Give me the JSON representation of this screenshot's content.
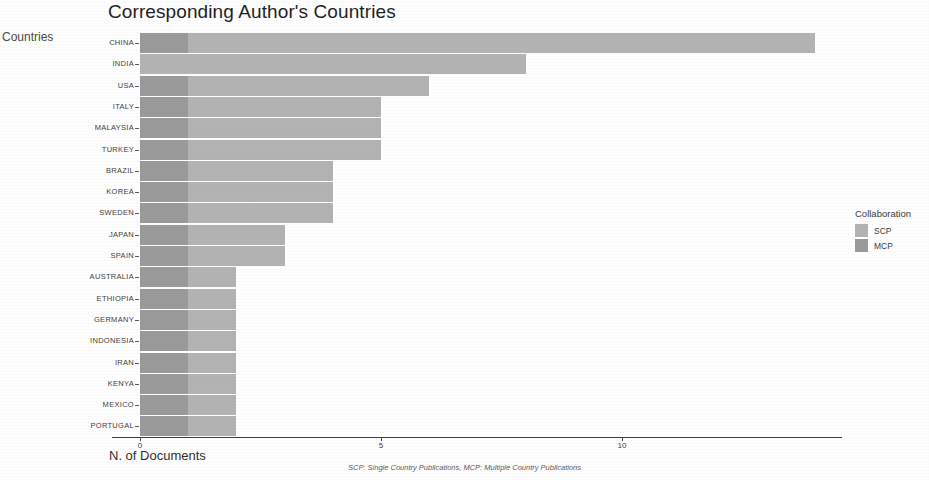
{
  "title": "Corresponding Author's Countries",
  "y_axis_title": "Countries",
  "x_axis_title": "N. of Documents",
  "caption": "SCP: Single Country Publications, MCP: Multiple Country Publications",
  "legend": {
    "title": "Collaboration",
    "items": [
      {
        "label": "SCP",
        "color": "#b3b3b3"
      },
      {
        "label": "MCP",
        "color": "#9a9a9a"
      }
    ]
  },
  "x_ticks": [
    {
      "label": "0",
      "value": 0
    },
    {
      "label": "5",
      "value": 5
    },
    {
      "label": "10",
      "value": 10
    }
  ],
  "chart_data": {
    "type": "bar",
    "orientation": "horizontal",
    "stacked": true,
    "title": "Corresponding Author's Countries",
    "xlabel": "N. of Documents",
    "ylabel": "Countries",
    "xlim": [
      0,
      14.5
    ],
    "grid": false,
    "legend_position": "right",
    "legend_title": "Collaboration",
    "categories": [
      "CHINA",
      "INDIA",
      "USA",
      "ITALY",
      "MALAYSIA",
      "TURKEY",
      "BRAZIL",
      "KOREA",
      "SWEDEN",
      "JAPAN",
      "SPAIN",
      "AUSTRALIA",
      "ETHIOPIA",
      "GERMANY",
      "INDONESIA",
      "IRAN",
      "KENYA",
      "MEXICO",
      "PORTUGAL"
    ],
    "series": [
      {
        "name": "MCP",
        "color": "#9a9a9a",
        "values": [
          1,
          0,
          1,
          1,
          1,
          1,
          1,
          1,
          1,
          1,
          1,
          1,
          1,
          1,
          1,
          1,
          1,
          1,
          1
        ]
      },
      {
        "name": "SCP",
        "color": "#b3b3b3",
        "values": [
          13,
          8,
          5,
          4,
          4,
          4,
          3,
          3,
          3,
          2,
          2,
          1,
          1,
          1,
          1,
          1,
          1,
          1,
          1
        ]
      }
    ],
    "totals": [
      14,
      8,
      6,
      5,
      5,
      5,
      4,
      4,
      4,
      3,
      3,
      2,
      2,
      2,
      2,
      2,
      2,
      2,
      2
    ]
  }
}
